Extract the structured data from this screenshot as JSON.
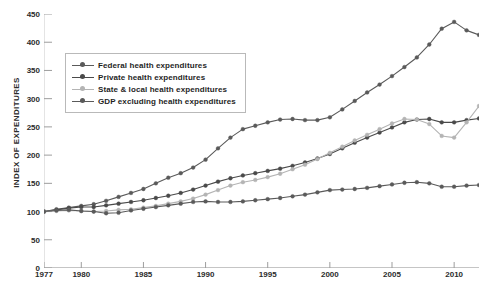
{
  "chart_data": {
    "type": "line",
    "title": "",
    "xlabel": "",
    "ylabel": "INDEX OF EXPENDITURES",
    "xlim": [
      1977,
      2012
    ],
    "ylim": [
      0,
      450
    ],
    "ytick_labels": [
      "0",
      "50",
      "100",
      "150",
      "200",
      "250",
      "300",
      "350",
      "400",
      "450"
    ],
    "ytick_values": [
      0,
      50,
      100,
      150,
      200,
      250,
      300,
      350,
      400,
      450
    ],
    "xtick_labels": [
      "1977",
      "1980",
      "1985",
      "1990",
      "1995",
      "2000",
      "2005",
      "2010"
    ],
    "xtick_values": [
      1977,
      1980,
      1985,
      1990,
      1995,
      2000,
      2005,
      2010
    ],
    "grid": false,
    "legend_position": "upper-left",
    "x": [
      1977,
      1978,
      1979,
      1980,
      1981,
      1982,
      1983,
      1984,
      1985,
      1986,
      1987,
      1988,
      1989,
      1990,
      1991,
      1992,
      1993,
      1994,
      1995,
      1996,
      1997,
      1998,
      1999,
      2000,
      2001,
      2002,
      2003,
      2004,
      2005,
      2006,
      2007,
      2008,
      2009,
      2010,
      2011,
      2012
    ],
    "series": [
      {
        "name": "Federal health expenditures",
        "color": "#5a5a5a",
        "values": [
          100,
          104,
          107,
          110,
          113,
          119,
          126,
          133,
          140,
          150,
          160,
          168,
          178,
          192,
          212,
          231,
          246,
          252,
          258,
          263,
          264,
          262,
          262,
          267,
          281,
          296,
          311,
          325,
          340,
          356,
          373,
          396,
          424,
          436,
          421,
          413
        ]
      },
      {
        "name": "Private health expenditures",
        "color": "#4a4a4a",
        "values": [
          100,
          103,
          106,
          108,
          108,
          111,
          114,
          117,
          120,
          124,
          128,
          133,
          139,
          146,
          153,
          159,
          164,
          168,
          172,
          176,
          181,
          187,
          194,
          202,
          212,
          222,
          231,
          240,
          249,
          258,
          263,
          264,
          258,
          258,
          262,
          265
        ]
      },
      {
        "name": "State & local health expenditures",
        "color": "#b4b4b4",
        "values": [
          100,
          101,
          102,
          101,
          100,
          101,
          103,
          104,
          107,
          110,
          114,
          118,
          123,
          130,
          138,
          146,
          152,
          156,
          161,
          167,
          175,
          183,
          193,
          204,
          215,
          226,
          236,
          246,
          256,
          264,
          263,
          255,
          234,
          231,
          258,
          287
        ]
      },
      {
        "name": "GDP excluding health expenditures",
        "color": "#5a5a5a",
        "values": [
          100,
          102,
          103,
          101,
          100,
          97,
          98,
          102,
          105,
          108,
          111,
          114,
          117,
          118,
          117,
          117,
          118,
          120,
          122,
          124,
          127,
          130,
          134,
          138,
          139,
          140,
          142,
          145,
          148,
          151,
          152,
          150,
          144,
          144,
          146,
          147
        ]
      }
    ]
  },
  "legend": {
    "items": [
      {
        "label": "Federal health expenditures"
      },
      {
        "label": "Private health expenditures"
      },
      {
        "label": "State & local health expenditures"
      },
      {
        "label": "GDP excluding health expenditures"
      }
    ]
  }
}
